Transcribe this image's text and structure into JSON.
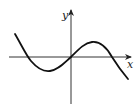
{
  "diagram": {
    "type": "function-graph",
    "axes": {
      "x_label": "x",
      "y_label": "y"
    },
    "colors": {
      "stroke": "#111111",
      "axis": "#333333",
      "background": "#ffffff"
    },
    "features": {
      "x_intercepts": [
        "negative",
        "origin",
        "positive"
      ],
      "local_min": "left of y-axis, below x-axis",
      "local_max": "right of y-axis, above x-axis",
      "end_behavior": "rises to the left, falls to the right"
    }
  }
}
